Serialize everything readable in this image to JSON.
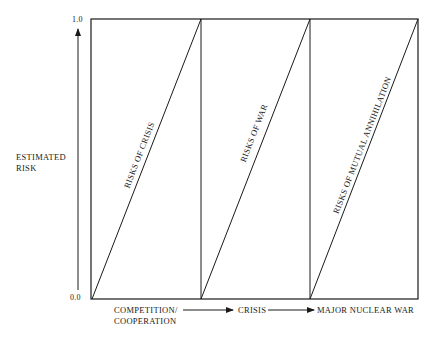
{
  "diagram": {
    "y_axis": {
      "label_line1": "ESTIMATED",
      "label_line2": "RISK",
      "tick_top": "1.0",
      "tick_bottom": "0.0"
    },
    "x_axis": {
      "stage1_line1": "COMPETITION/",
      "stage1_line2": "COOPERATION",
      "stage2": "CRISIS",
      "stage3": "MAJOR NUCLEAR WAR"
    },
    "sections": [
      {
        "label": "RISKS OF CRISIS"
      },
      {
        "label": "RISKS OF WAR"
      },
      {
        "label": "RISKS OF MUTUAL ANNIHILATION"
      }
    ],
    "colors": {
      "line": "#1a1a1a",
      "background": "#ffffff"
    }
  }
}
